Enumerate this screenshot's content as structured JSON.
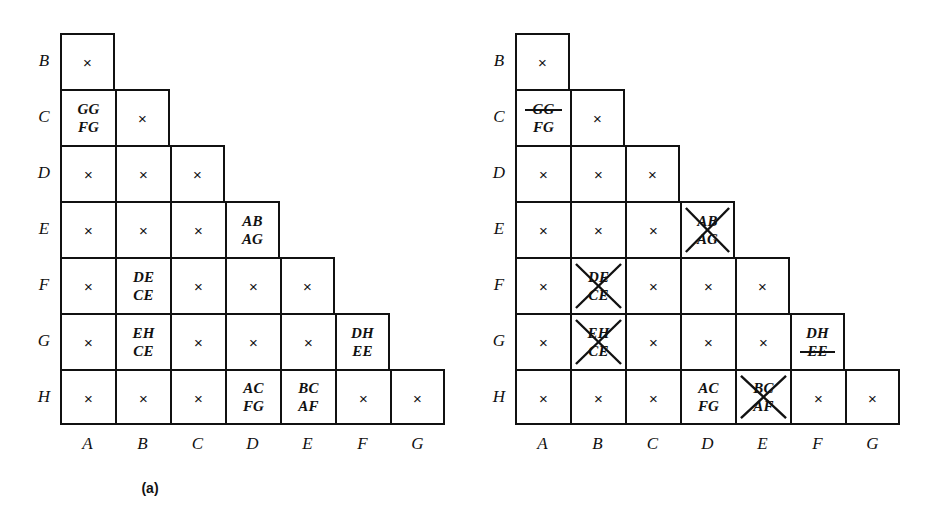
{
  "figure": {
    "row_labels": [
      "B",
      "C",
      "D",
      "E",
      "F",
      "G",
      "H"
    ],
    "col_labels": [
      "A",
      "B",
      "C",
      "D",
      "E",
      "F",
      "G"
    ],
    "x_glyph": "×"
  },
  "panels": [
    {
      "id": "a",
      "caption": "(a)",
      "rows": [
        {
          "label": "B",
          "cells": [
            {
              "type": "x",
              "mark": "×"
            }
          ]
        },
        {
          "label": "C",
          "cells": [
            {
              "type": "pair",
              "top": "GG",
              "bottom": "FG",
              "top_struck": false,
              "bottom_struck": false,
              "crossed": false
            },
            {
              "type": "x",
              "mark": "×"
            }
          ]
        },
        {
          "label": "D",
          "cells": [
            {
              "type": "x",
              "mark": "×"
            },
            {
              "type": "x",
              "mark": "×"
            },
            {
              "type": "x",
              "mark": "×"
            }
          ]
        },
        {
          "label": "E",
          "cells": [
            {
              "type": "x",
              "mark": "×"
            },
            {
              "type": "x",
              "mark": "×"
            },
            {
              "type": "x",
              "mark": "×"
            },
            {
              "type": "pair",
              "top": "AB",
              "bottom": "AG",
              "top_struck": false,
              "bottom_struck": false,
              "crossed": false
            }
          ]
        },
        {
          "label": "F",
          "cells": [
            {
              "type": "x",
              "mark": "×"
            },
            {
              "type": "pair",
              "top": "DE",
              "bottom": "CE",
              "top_struck": false,
              "bottom_struck": false,
              "crossed": false
            },
            {
              "type": "x",
              "mark": "×"
            },
            {
              "type": "x",
              "mark": "×"
            },
            {
              "type": "x",
              "mark": "×"
            }
          ]
        },
        {
          "label": "G",
          "cells": [
            {
              "type": "x",
              "mark": "×"
            },
            {
              "type": "pair",
              "top": "EH",
              "bottom": "CE",
              "top_struck": false,
              "bottom_struck": false,
              "crossed": false
            },
            {
              "type": "x",
              "mark": "×"
            },
            {
              "type": "x",
              "mark": "×"
            },
            {
              "type": "x",
              "mark": "×"
            },
            {
              "type": "pair",
              "top": "DH",
              "bottom": "EE",
              "top_struck": false,
              "bottom_struck": false,
              "crossed": false
            }
          ]
        },
        {
          "label": "H",
          "cells": [
            {
              "type": "x",
              "mark": "×"
            },
            {
              "type": "x",
              "mark": "×"
            },
            {
              "type": "x",
              "mark": "×"
            },
            {
              "type": "pair",
              "top": "AC",
              "bottom": "FG",
              "top_struck": false,
              "bottom_struck": false,
              "crossed": false
            },
            {
              "type": "pair",
              "top": "BC",
              "bottom": "AF",
              "top_struck": false,
              "bottom_struck": false,
              "crossed": false
            },
            {
              "type": "x",
              "mark": "×"
            },
            {
              "type": "x",
              "mark": "×"
            }
          ]
        }
      ]
    },
    {
      "id": "b",
      "caption": "(b)",
      "rows": [
        {
          "label": "B",
          "cells": [
            {
              "type": "x",
              "mark": "×"
            }
          ]
        },
        {
          "label": "C",
          "cells": [
            {
              "type": "pair",
              "top": "GG",
              "bottom": "FG",
              "top_struck": true,
              "bottom_struck": false,
              "crossed": false
            },
            {
              "type": "x",
              "mark": "×"
            }
          ]
        },
        {
          "label": "D",
          "cells": [
            {
              "type": "x",
              "mark": "×"
            },
            {
              "type": "x",
              "mark": "×"
            },
            {
              "type": "x",
              "mark": "×"
            }
          ]
        },
        {
          "label": "E",
          "cells": [
            {
              "type": "x",
              "mark": "×"
            },
            {
              "type": "x",
              "mark": "×"
            },
            {
              "type": "x",
              "mark": "×"
            },
            {
              "type": "pair",
              "top": "AB",
              "bottom": "AG",
              "top_struck": false,
              "bottom_struck": false,
              "crossed": true
            }
          ]
        },
        {
          "label": "F",
          "cells": [
            {
              "type": "x",
              "mark": "×"
            },
            {
              "type": "pair",
              "top": "DE",
              "bottom": "CE",
              "top_struck": false,
              "bottom_struck": false,
              "crossed": true
            },
            {
              "type": "x",
              "mark": "×"
            },
            {
              "type": "x",
              "mark": "×"
            },
            {
              "type": "x",
              "mark": "×"
            }
          ]
        },
        {
          "label": "G",
          "cells": [
            {
              "type": "x",
              "mark": "×"
            },
            {
              "type": "pair",
              "top": "EH",
              "bottom": "CE",
              "top_struck": false,
              "bottom_struck": false,
              "crossed": true
            },
            {
              "type": "x",
              "mark": "×"
            },
            {
              "type": "x",
              "mark": "×"
            },
            {
              "type": "x",
              "mark": "×"
            },
            {
              "type": "pair",
              "top": "DH",
              "bottom": "EE",
              "top_struck": false,
              "bottom_struck": true,
              "crossed": false
            }
          ]
        },
        {
          "label": "H",
          "cells": [
            {
              "type": "x",
              "mark": "×"
            },
            {
              "type": "x",
              "mark": "×"
            },
            {
              "type": "x",
              "mark": "×"
            },
            {
              "type": "pair",
              "top": "AC",
              "bottom": "FG",
              "top_struck": false,
              "bottom_struck": false,
              "crossed": false
            },
            {
              "type": "pair",
              "top": "BC",
              "bottom": "AF",
              "top_struck": false,
              "bottom_struck": false,
              "crossed": true
            },
            {
              "type": "x",
              "mark": "×"
            },
            {
              "type": "x",
              "mark": "×"
            }
          ]
        }
      ]
    }
  ]
}
